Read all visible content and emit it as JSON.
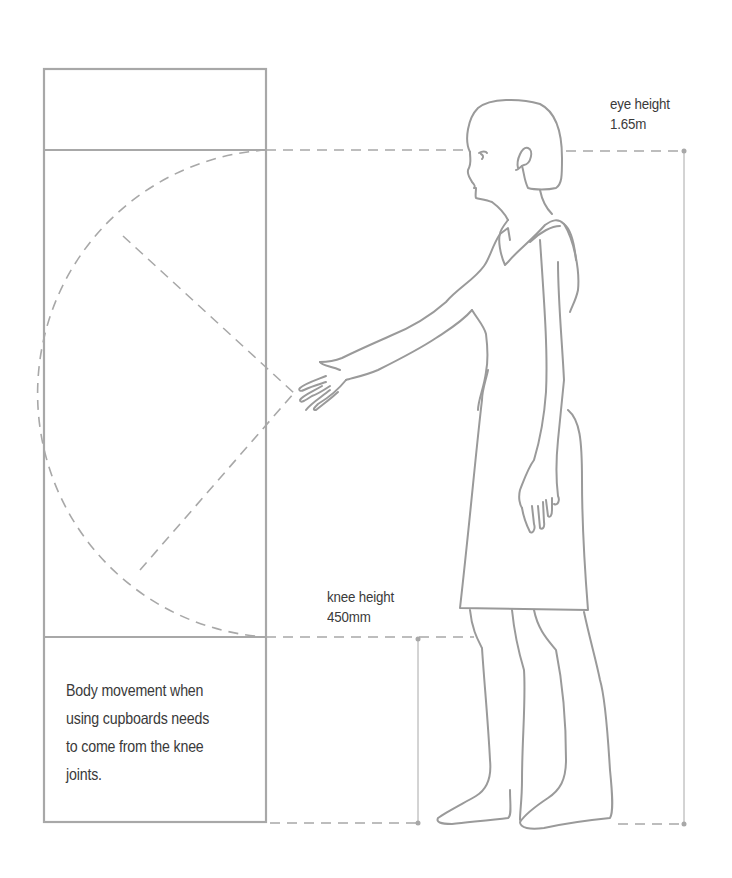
{
  "diagram": {
    "colors": {
      "line": "#a8a8a8",
      "figure": "#9a9a9a",
      "text": "#3a3a3a",
      "background": "#ffffff"
    },
    "labels": {
      "eye": {
        "line1": "eye height",
        "line2": "1.65m"
      },
      "knee": {
        "line1": "knee height",
        "line2": "450mm"
      }
    },
    "note": {
      "lines": [
        "Body movement when",
        "using cupboards needs",
        "to come from the knee",
        "joints."
      ]
    },
    "elements": {
      "cupboard": "tall cupboard with top compartment, main section and lower section",
      "reach_arc": "dashed semicircular reach arc from hand",
      "figure": "standing woman reaching forward",
      "dimension_lines": [
        "eye height 1.65m",
        "knee height 450mm"
      ]
    }
  }
}
